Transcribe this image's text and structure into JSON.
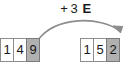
{
  "diagram": {
    "type": "place-value-addition",
    "operation": {
      "sign": "+",
      "amount": "3",
      "unit": "E",
      "full_label": "+ 3 E"
    },
    "arrow": {
      "icon": "curved-arrow-right",
      "color": "#8d8d8d",
      "from": "source-digit-9",
      "to": "result-digit-2"
    },
    "colors": {
      "cell_border": "#8d8d8d",
      "cell_background": "#ffffff",
      "highlight_background": "#b0b0b0",
      "text": "#1a1a1a"
    },
    "source": {
      "name": "source-number",
      "value": "149",
      "digits": [
        {
          "digit": "1",
          "highlighted": false
        },
        {
          "digit": "4",
          "highlighted": false
        },
        {
          "digit": "9",
          "highlighted": true
        }
      ]
    },
    "result": {
      "name": "result-number",
      "value": "152",
      "digits": [
        {
          "digit": "1",
          "highlighted": false
        },
        {
          "digit": "5",
          "highlighted": false
        },
        {
          "digit": "2",
          "highlighted": true
        }
      ]
    }
  }
}
